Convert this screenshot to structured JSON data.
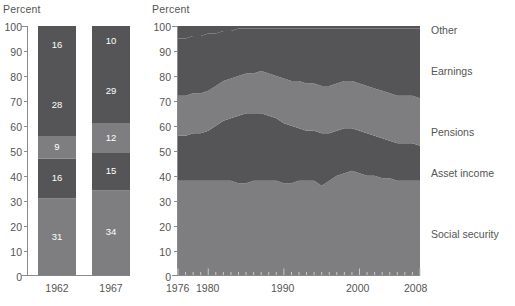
{
  "panels": {
    "left": {
      "axis_title": "Percent",
      "y_ticks": [
        "100",
        "90",
        "80",
        "70",
        "60",
        "50",
        "40",
        "30",
        "20",
        "10",
        "0"
      ],
      "categories": [
        "1962",
        "1967"
      ]
    },
    "right": {
      "axis_title": "Percent",
      "y_ticks": [
        "100",
        "90",
        "80",
        "70",
        "60",
        "50",
        "40",
        "30",
        "20",
        "10",
        "0"
      ],
      "x_ticks": [
        "1976",
        "1980",
        "1990",
        "2000",
        "2008"
      ],
      "series_labels": [
        "Other",
        "Earnings",
        "Pensions",
        "Asset income",
        "Social security"
      ]
    }
  },
  "colors": {
    "dark": "#555558",
    "light": "#7e7e80",
    "background": "#ffffff",
    "text": "#555555",
    "value_text": "#ffffff"
  },
  "chart_data": [
    {
      "type": "bar",
      "title": "Percent",
      "xlabel": "",
      "ylabel": "Percent",
      "ylim": [
        0,
        100
      ],
      "grid": false,
      "stacked": true,
      "categories": [
        "1962",
        "1967"
      ],
      "series": [
        {
          "name": "Social security",
          "shade": "light",
          "values": [
            31,
            34
          ]
        },
        {
          "name": "Asset income",
          "shade": "dark",
          "values": [
            16,
            15
          ]
        },
        {
          "name": "Pensions",
          "shade": "light",
          "values": [
            9,
            12
          ]
        },
        {
          "name": "Earnings",
          "shade": "dark",
          "values": [
            28,
            29
          ]
        },
        {
          "name": "Other",
          "shade": "dark",
          "values": [
            16,
            10
          ]
        }
      ]
    },
    {
      "type": "area",
      "title": "Percent",
      "xlabel": "",
      "ylabel": "Percent",
      "ylim": [
        0,
        100
      ],
      "xlim": [
        1976,
        2008
      ],
      "grid": false,
      "stacked": true,
      "legend_position": "right",
      "x": [
        1976,
        1977,
        1978,
        1979,
        1980,
        1981,
        1982,
        1983,
        1984,
        1985,
        1986,
        1987,
        1988,
        1989,
        1990,
        1991,
        1992,
        1993,
        1994,
        1995,
        1996,
        1997,
        1998,
        1999,
        2000,
        2001,
        2002,
        2003,
        2004,
        2005,
        2006,
        2007,
        2008
      ],
      "series": [
        {
          "name": "Social security",
          "shade": "light",
          "values": [
            38,
            38,
            38,
            38,
            38,
            38,
            38,
            38,
            37,
            37,
            38,
            38,
            38,
            38,
            37,
            37,
            38,
            38,
            38,
            36,
            38,
            40,
            41,
            42,
            41,
            40,
            40,
            39,
            39,
            38,
            38,
            38,
            38
          ]
        },
        {
          "name": "Asset income",
          "shade": "dark",
          "values": [
            18,
            18,
            19,
            19,
            20,
            22,
            24,
            25,
            27,
            28,
            27,
            27,
            26,
            25,
            24,
            23,
            21,
            20,
            20,
            21,
            19,
            18,
            18,
            17,
            17,
            17,
            16,
            16,
            15,
            15,
            15,
            15,
            14
          ]
        },
        {
          "name": "Pensions",
          "shade": "light",
          "values": [
            16,
            16,
            16,
            16,
            16,
            16,
            16,
            16,
            16,
            16,
            16,
            17,
            17,
            17,
            18,
            18,
            19,
            19,
            19,
            19,
            19,
            19,
            19,
            19,
            19,
            19,
            19,
            19,
            19,
            19,
            19,
            19,
            19
          ]
        },
        {
          "name": "Earnings",
          "shade": "dark",
          "values": [
            23,
            23,
            23,
            23,
            23,
            21,
            20,
            19,
            19,
            18,
            18,
            17,
            18,
            19,
            20,
            21,
            21,
            22,
            22,
            23,
            23,
            22,
            21,
            21,
            22,
            23,
            24,
            25,
            26,
            27,
            27,
            27,
            28
          ]
        },
        {
          "name": "Other",
          "shade": "dark",
          "values": [
            5,
            5,
            4,
            4,
            3,
            3,
            2,
            2,
            1,
            1,
            1,
            1,
            1,
            1,
            1,
            1,
            1,
            1,
            1,
            1,
            1,
            1,
            1,
            1,
            1,
            1,
            1,
            1,
            1,
            1,
            1,
            1,
            1
          ]
        }
      ]
    }
  ]
}
